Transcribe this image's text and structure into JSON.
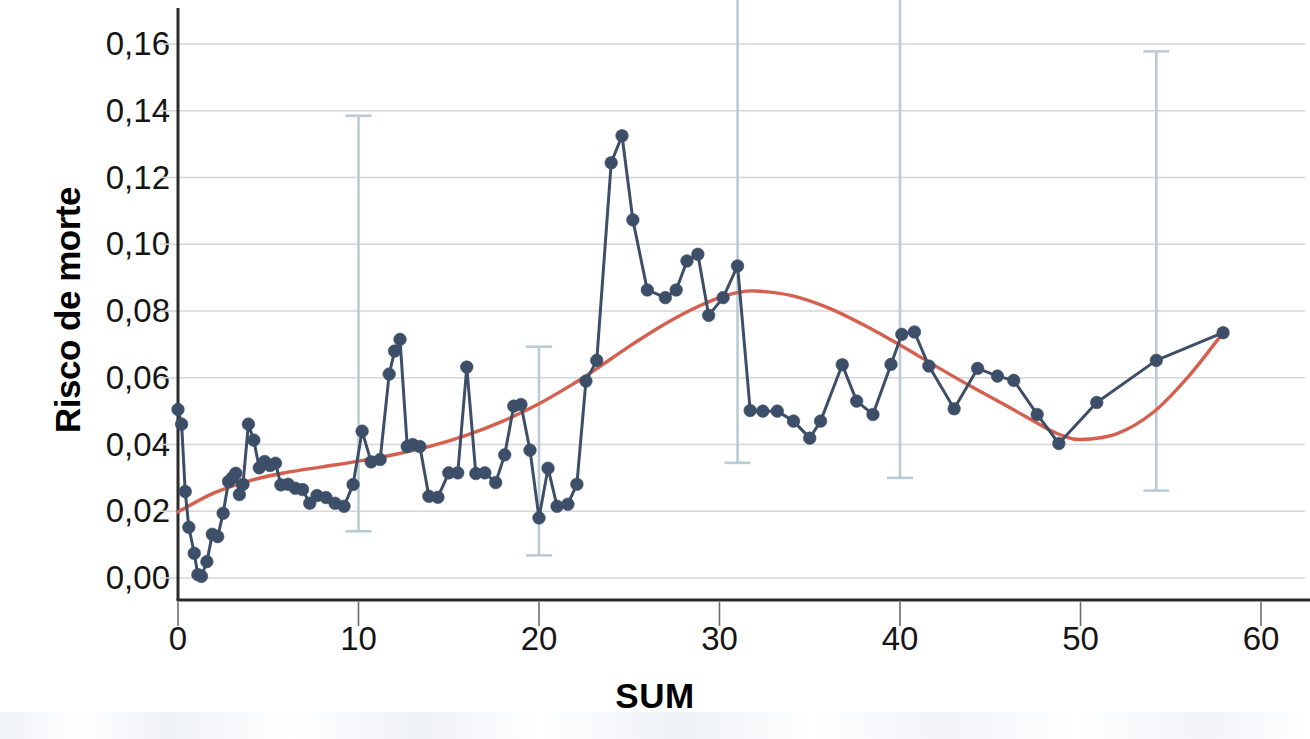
{
  "chart_data": {
    "type": "line",
    "title": "",
    "subtitle": "",
    "xlabel": "SUM",
    "ylabel": "Risco de morte",
    "xlim": [
      -1.2,
      61.5
    ],
    "ylim": [
      -0.006,
      0.172
    ],
    "grid": true,
    "legend": null,
    "x_ticks": [
      0,
      10,
      20,
      30,
      40,
      50,
      60
    ],
    "x_tick_labels": [
      "0",
      "10",
      "20",
      "30",
      "40",
      "50",
      "60"
    ],
    "y_ticks": [
      0.0,
      0.02,
      0.04,
      0.06,
      0.08,
      0.1,
      0.12,
      0.14,
      0.16
    ],
    "y_tick_labels": [
      "0,00",
      "0,02",
      "0,04",
      "0,06",
      "0,08",
      "0,10",
      "0,12",
      "0,14",
      "0,16"
    ],
    "colors": {
      "observed_line": "#3d4f68",
      "observed_marker": "#35486280",
      "fit_line": "#d5604f",
      "error_bar": "#b9ccd3",
      "grid": "#d6d6d6",
      "axis": "#2b2b2b",
      "text": "#151515"
    },
    "series": [
      {
        "name": "Risco de morte observado",
        "type": "line-markers",
        "color": "#3d4f68",
        "x": [
          0.0,
          0.2,
          0.4,
          0.6,
          0.9,
          1.1,
          1.3,
          1.6,
          1.9,
          2.2,
          2.5,
          2.8,
          3.0,
          3.2,
          3.4,
          3.6,
          3.9,
          4.2,
          4.5,
          4.8,
          5.1,
          5.4,
          5.7,
          6.1,
          6.5,
          6.9,
          7.3,
          7.7,
          8.2,
          8.7,
          9.2,
          9.7,
          10.2,
          10.7,
          11.2,
          11.7,
          12.0,
          12.3,
          12.7,
          13.0,
          13.4,
          13.9,
          14.4,
          15.0,
          15.5,
          16.0,
          16.5,
          17.0,
          17.6,
          18.1,
          18.6,
          19.0,
          19.5,
          20.0,
          20.5,
          21.0,
          21.6,
          22.1,
          22.6,
          23.2,
          24.0,
          24.6,
          25.2,
          26.0,
          27.0,
          27.6,
          28.2,
          28.8,
          29.4,
          30.2,
          31.0,
          31.7,
          32.4,
          33.2,
          34.1,
          35.0,
          35.6,
          36.8,
          37.6,
          38.5,
          39.5,
          40.1,
          40.8,
          41.6,
          43.0,
          44.3,
          45.4,
          46.3,
          47.6,
          48.8,
          50.9,
          54.2,
          57.9
        ],
        "y": [
          0.0505,
          0.0461,
          0.0259,
          0.0152,
          0.0074,
          0.001,
          0.0005,
          0.0049,
          0.0131,
          0.0124,
          0.0194,
          0.0289,
          0.03,
          0.0314,
          0.025,
          0.0281,
          0.0461,
          0.0413,
          0.033,
          0.0349,
          0.0337,
          0.0344,
          0.0279,
          0.0281,
          0.0269,
          0.0265,
          0.0224,
          0.0247,
          0.0241,
          0.0224,
          0.0215,
          0.028,
          0.044,
          0.0348,
          0.0355,
          0.0611,
          0.068,
          0.0715,
          0.0394,
          0.04,
          0.0394,
          0.0245,
          0.0242,
          0.0315,
          0.0315,
          0.0632,
          0.0313,
          0.0315,
          0.0286,
          0.0369,
          0.0515,
          0.052,
          0.0383,
          0.018,
          0.0329,
          0.0215,
          0.0221,
          0.0281,
          0.059,
          0.0652,
          0.1244,
          0.1325,
          0.1073,
          0.0863,
          0.084,
          0.0863,
          0.095,
          0.097,
          0.0787,
          0.084,
          0.0935,
          0.0502,
          0.05,
          0.05,
          0.047,
          0.0419,
          0.047,
          0.0639,
          0.053,
          0.049,
          0.064,
          0.073,
          0.0737,
          0.0635,
          0.0507,
          0.0628,
          0.0605,
          0.0592,
          0.049,
          0.0403,
          0.0526,
          0.0652,
          0.0735
        ]
      },
      {
        "name": "Curva ajustada (cúbica)",
        "type": "line",
        "color": "#d5604f",
        "x": [
          0.0,
          2.0,
          4.0,
          6.0,
          8.0,
          10.0,
          12.0,
          14.0,
          16.0,
          18.0,
          20.0,
          22.0,
          23.0,
          24.0,
          25.0,
          26.0,
          27.0,
          28.0,
          29.0,
          30.0,
          31.0,
          32.0,
          34.0,
          36.0,
          38.0,
          40.0,
          42.0,
          44.0,
          46.0,
          48.0,
          49.0,
          50.0,
          52.0,
          54.0,
          56.0,
          57.9
        ],
        "y": [
          0.0198,
          0.0255,
          0.0292,
          0.0316,
          0.0333,
          0.035,
          0.037,
          0.0395,
          0.0428,
          0.047,
          0.0522,
          0.0585,
          0.062,
          0.0657,
          0.0694,
          0.0729,
          0.0762,
          0.0792,
          0.0818,
          0.084,
          0.0855,
          0.086,
          0.0846,
          0.081,
          0.0758,
          0.0698,
          0.0634,
          0.0572,
          0.0513,
          0.0452,
          0.0427,
          0.0415,
          0.0432,
          0.0495,
          0.0605,
          0.0735
        ]
      }
    ],
    "error_bars": [
      {
        "x": 10.0,
        "y_low": 0.014,
        "y_high": 0.1385,
        "top_capped": true,
        "bottom_capped": true
      },
      {
        "x": 20.0,
        "y_low": 0.0068,
        "y_high": 0.0693,
        "top_capped": true,
        "bottom_capped": true
      },
      {
        "x": 31.0,
        "y_low": 0.0345,
        "y_high": 0.174,
        "top_capped": false,
        "bottom_capped": true
      },
      {
        "x": 40.0,
        "y_low": 0.03,
        "y_high": 0.174,
        "top_capped": false,
        "bottom_capped": true
      },
      {
        "x": 54.2,
        "y_low": 0.0262,
        "y_high": 0.1578,
        "top_capped": true,
        "bottom_capped": true
      }
    ]
  }
}
